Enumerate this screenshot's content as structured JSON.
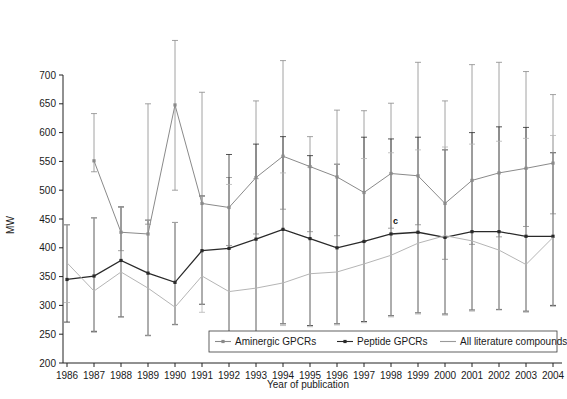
{
  "chart_data": {
    "type": "line",
    "title": "",
    "xlabel": "Year of publication",
    "ylabel": "MW",
    "categories": [
      1986,
      1987,
      1988,
      1989,
      1990,
      1991,
      1992,
      1993,
      1994,
      1995,
      1996,
      1997,
      1998,
      1999,
      2000,
      2001,
      2002,
      2003,
      2004
    ],
    "x": [
      1986,
      1987,
      1988,
      1989,
      1990,
      1991,
      1992,
      1993,
      1994,
      1995,
      1996,
      1997,
      1998,
      1999,
      2000,
      2001,
      2002,
      2003,
      2004
    ],
    "xlim": [
      1986,
      2004
    ],
    "ylim": [
      200,
      700
    ],
    "yticks": [
      200,
      250,
      300,
      350,
      400,
      450,
      500,
      550,
      600,
      650,
      700
    ],
    "xticks": [
      1986,
      1987,
      1988,
      1989,
      1990,
      1991,
      1992,
      1993,
      1994,
      1995,
      1996,
      1997,
      1998,
      1999,
      2000,
      2001,
      2002,
      2003,
      2004
    ],
    "grid": false,
    "legend_position": "bottom-inside",
    "error_bars": "vertical with caps (mean +/- SD)",
    "annotations": [
      {
        "text": "c",
        "x": 1998,
        "y": 441
      }
    ],
    "series": [
      {
        "name": "Aminergic GPCRs",
        "color": "#8a8a8a",
        "marker": "square-small",
        "values": [
          null,
          551,
          427,
          424,
          648,
          477,
          470,
          522,
          559,
          541,
          523,
          496,
          529,
          525,
          477,
          517,
          530,
          538,
          547
        ],
        "err_upper": [
          null,
          633,
          471,
          650,
          800,
          670,
          522,
          655,
          725,
          593,
          639,
          638,
          651,
          722,
          655,
          718,
          722,
          706,
          666
        ],
        "err_lower": [
          null,
          532,
          395,
          441,
          500,
          490,
          404,
          424,
          467,
          428,
          421,
          411,
          434,
          440,
          380,
          406,
          419,
          437,
          459
        ]
      },
      {
        "name": "Peptide GPCRs",
        "color": "#2a2a2a",
        "marker": "square-small",
        "values": [
          345,
          351,
          378,
          356,
          340,
          395,
          399,
          415,
          432,
          416,
          400,
          411,
          424,
          427,
          418,
          428,
          428,
          420,
          420
        ],
        "err_upper": [
          440,
          452,
          471,
          448,
          444,
          490,
          562,
          580,
          593,
          560,
          545,
          592,
          589,
          592,
          570,
          600,
          610,
          609,
          565
        ],
        "err_lower": [
          271,
          255,
          280,
          248,
          267,
          302,
          254,
          247,
          268,
          265,
          268,
          272,
          282,
          287,
          285,
          292,
          293,
          290,
          300
        ]
      },
      {
        "name": "All literature compounds",
        "color": "#b5b5b5",
        "marker": "none",
        "values": [
          374,
          325,
          358,
          330,
          297,
          351,
          324,
          330,
          339,
          355,
          358,
          372,
          387,
          408,
          421,
          412,
          396,
          371,
          418
        ],
        "err_upper": [
          440,
          452,
          471,
          448,
          444,
          490,
          510,
          520,
          530,
          540,
          545,
          555,
          565,
          570,
          575,
          580,
          585,
          590,
          595
        ],
        "err_lower": [
          305,
          253,
          279,
          247,
          266,
          288,
          253,
          244,
          265,
          263,
          266,
          270,
          280,
          285,
          283,
          290,
          292,
          288,
          298
        ]
      }
    ]
  },
  "axes": {
    "y_title": "MW",
    "x_title": "Year of publication",
    "y_tick_labels": [
      "700",
      "650",
      "600",
      "550",
      "500",
      "450",
      "400",
      "350",
      "300",
      "250",
      "200"
    ],
    "x_tick_labels": [
      "1986",
      "1987",
      "1988",
      "1989",
      "1990",
      "1991",
      "1992",
      "1993",
      "1994",
      "1995",
      "1996",
      "1997",
      "1998",
      "1999",
      "2000",
      "2001",
      "2002",
      "2003",
      "2004"
    ]
  },
  "legend": {
    "items": [
      {
        "label": "Aminergic GPCRs",
        "color": "#8a8a8a",
        "marker": "square-small"
      },
      {
        "label": "Peptide GPCRs",
        "color": "#2a2a2a",
        "marker": "square-small"
      },
      {
        "label": "All literature compounds",
        "color": "#9a9a9a",
        "marker": "none"
      }
    ]
  },
  "annotation_label": "c",
  "colors": {
    "aminergic": "#8a8a8a",
    "peptide": "#2a2a2a",
    "all_literature": "#b5b5b5",
    "axis": "#222222",
    "background": "#ffffff"
  }
}
